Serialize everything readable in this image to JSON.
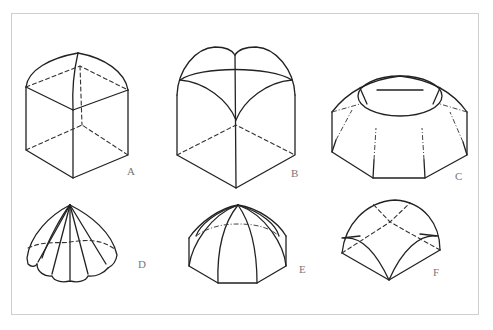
{
  "figure": {
    "panels": [
      {
        "id": "A",
        "label": "A",
        "description": "cloister vault on square base"
      },
      {
        "id": "B",
        "label": "B",
        "description": "groin/rib vault on square base"
      },
      {
        "id": "C",
        "label": "C",
        "description": "octagonal dome with oculus"
      },
      {
        "id": "D",
        "label": "D",
        "description": "ribbed scalloped dome"
      },
      {
        "id": "E",
        "label": "E",
        "description": "octagonal ribbed dome"
      },
      {
        "id": "F",
        "label": "F",
        "description": "sail vault / domical vault"
      }
    ]
  },
  "colors": {
    "ink": "#222222",
    "frame": "#cfcfcf",
    "label": "#777777",
    "background": "#ffffff"
  }
}
